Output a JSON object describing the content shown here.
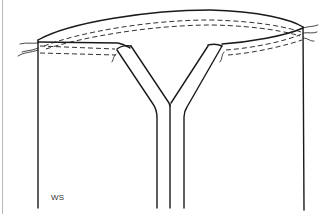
{
  "figure": {
    "label": "WS",
    "line_color": "#1a1a1a",
    "border_color": "#b8b8b8",
    "background": "#ffffff"
  }
}
